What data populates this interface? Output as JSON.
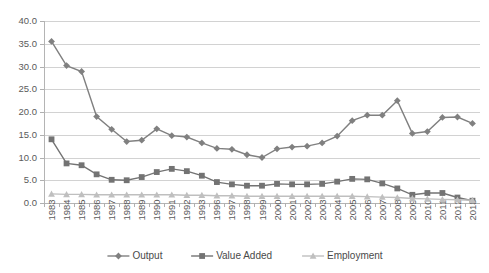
{
  "chart_data": {
    "type": "line",
    "title": "",
    "subtitle": "",
    "xlabel": "",
    "ylabel": "",
    "ylim": [
      0.0,
      40.0
    ],
    "ytick_step": 5.0,
    "ytick_labels": [
      "0.0",
      "5.0",
      "10.0",
      "15.0",
      "20.0",
      "25.0",
      "30.0",
      "35.0",
      "40.0"
    ],
    "grid": true,
    "legend_position": "bottom",
    "categories": [
      "1983",
      "1984",
      "1985",
      "1986",
      "1987",
      "1988",
      "1989",
      "1990",
      "1991",
      "1992",
      "1993",
      "1996",
      "1997",
      "1998",
      "1999",
      "2000",
      "2001",
      "2002",
      "2003",
      "2004",
      "2005",
      "2006",
      "2007",
      "2008",
      "2009",
      "2010",
      "2011",
      "2012",
      "2013"
    ],
    "series": [
      {
        "name": "Output",
        "marker": "diamond",
        "color": "#808080",
        "values": [
          35.5,
          30.2,
          28.9,
          19.0,
          16.2,
          13.5,
          13.8,
          16.3,
          14.8,
          14.5,
          13.2,
          12.0,
          11.8,
          10.6,
          10.0,
          11.9,
          12.3,
          12.5,
          13.2,
          14.7,
          18.1,
          19.3,
          19.3,
          22.5,
          15.3,
          15.7,
          18.8,
          18.9,
          17.5
        ]
      },
      {
        "name": "Value Added",
        "marker": "square",
        "color": "#737373",
        "values": [
          14.0,
          8.7,
          8.3,
          6.3,
          5.1,
          5.0,
          5.7,
          6.8,
          7.5,
          7.0,
          6.0,
          4.6,
          4.1,
          3.8,
          3.8,
          4.2,
          4.1,
          4.1,
          4.2,
          4.7,
          5.3,
          5.2,
          4.3,
          3.2,
          1.8,
          2.2,
          2.2,
          1.2,
          0.5
        ]
      },
      {
        "name": "Employment",
        "marker": "triangle",
        "color": "#bfbfbf",
        "values": [
          2.0,
          1.9,
          1.9,
          1.8,
          1.8,
          1.8,
          1.8,
          1.8,
          1.8,
          1.7,
          1.7,
          1.6,
          1.6,
          1.5,
          1.5,
          1.5,
          1.5,
          1.5,
          1.5,
          1.5,
          1.5,
          1.4,
          1.3,
          1.2,
          1.0,
          0.9,
          0.8,
          0.7,
          0.6
        ]
      }
    ]
  },
  "legend": {
    "items": [
      {
        "label": "Output"
      },
      {
        "label": "Value Added"
      },
      {
        "label": "Employment"
      }
    ]
  }
}
